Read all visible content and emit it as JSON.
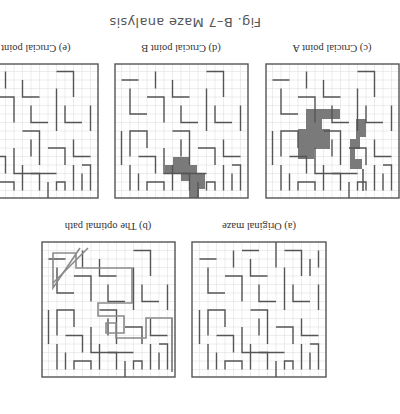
{
  "figure": {
    "title": "Fig. B–7   Maze analysis",
    "orientation": "rotated 180 degrees"
  },
  "panels": [
    {
      "id": "a",
      "caption": "(a) Original maze",
      "highlight": "none"
    },
    {
      "id": "b",
      "caption": "(b) The optimal path",
      "highlight": "path-line"
    },
    {
      "id": "c",
      "caption": "(c) Crucial point A",
      "highlight": "gray-region"
    },
    {
      "id": "d",
      "caption": "(d) Crucial point B",
      "highlight": "gray-region"
    },
    {
      "id": "e",
      "caption": "(e) Crucial point C",
      "highlight": "dark-region"
    }
  ],
  "colors": {
    "wall": "#555555",
    "grid": "#d8d8d8",
    "highlight_gray": "#7a7a7a",
    "highlight_dark": "#2a2a2a",
    "path": "#8a8a8a"
  }
}
